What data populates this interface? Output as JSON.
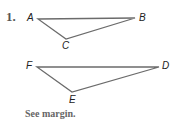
{
  "exercise": {
    "number": "1.",
    "note": "See margin."
  },
  "triangles": [
    {
      "name": "ABC",
      "vertices": [
        {
          "label": "A",
          "x": 38,
          "y": 19
        },
        {
          "label": "B",
          "x": 135,
          "y": 18
        },
        {
          "label": "C",
          "x": 66,
          "y": 39
        }
      ]
    },
    {
      "name": "FDE",
      "vertices": [
        {
          "label": "F",
          "x": 37,
          "y": 67
        },
        {
          "label": "D",
          "x": 159,
          "y": 67
        },
        {
          "label": "E",
          "x": 72,
          "y": 92
        }
      ]
    }
  ],
  "colors": {
    "stroke": "#6b6b6b",
    "label": "#222222",
    "note": "#666666"
  }
}
